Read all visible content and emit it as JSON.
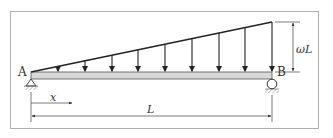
{
  "diagram": {
    "type": "simply-supported beam with linearly varying (triangular) distributed load",
    "labels": {
      "left_support": "A",
      "right_support": "B",
      "load_max": "ωL",
      "position_var": "x",
      "span": "L"
    },
    "load": {
      "shape": "triangular, zero at A increasing to maximum at B",
      "arrow_count": 9
    },
    "supports": {
      "A": "pin",
      "B": "roller"
    },
    "colors": {
      "frame": "#b0b0b0",
      "beam_fill": "#d8d8d8",
      "line": "#222222",
      "dimension": "#444444"
    }
  }
}
